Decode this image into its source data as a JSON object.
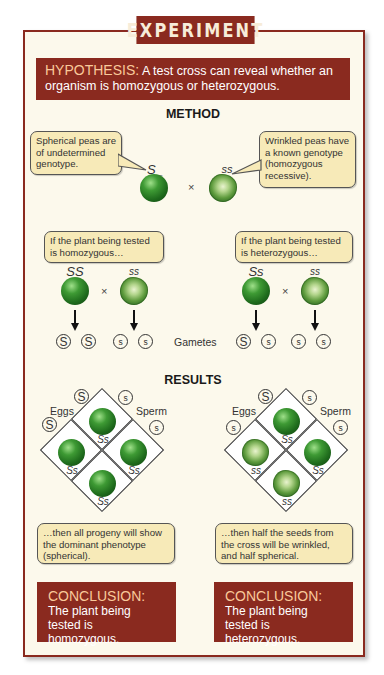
{
  "banner": {
    "title": "EXPERIMENT"
  },
  "hypothesis": {
    "label": "HYPOTHESIS:",
    "text": "A test cross can reveal whether an organism is homozygous or heterozygous."
  },
  "method": {
    "title": "METHOD",
    "left_callout": "Spherical peas are of undetermined genotype.",
    "right_callout": "Wrinkled peas have a known genotype (homozygous recessive).",
    "parent_left_genotype": "S_",
    "parent_right_genotype": "ss",
    "cross_symbol": "×",
    "cases": [
      {
        "callout": "If the plant being tested is homozygous…",
        "parent1_genotype": "SS",
        "parent2_genotype": "ss",
        "gametes": [
          "S",
          "S",
          "s",
          "s"
        ]
      },
      {
        "callout": "If the plant being tested is heterozygous…",
        "parent1_genotype": "Ss",
        "parent2_genotype": "ss",
        "gametes": [
          "S",
          "s",
          "s",
          "s"
        ]
      }
    ],
    "gametes_label": "Gametes"
  },
  "results": {
    "title": "RESULTS",
    "eggs_label": "Eggs",
    "sperm_label": "Sperm",
    "squares": [
      {
        "egg_alleles": [
          "S",
          "S"
        ],
        "sperm_alleles": [
          "s",
          "s"
        ],
        "cells": [
          {
            "genotype": "Ss",
            "phenotype": "spherical"
          },
          {
            "genotype": "Ss",
            "phenotype": "spherical"
          },
          {
            "genotype": "Ss",
            "phenotype": "spherical"
          },
          {
            "genotype": "Ss",
            "phenotype": "spherical"
          }
        ],
        "callout": "…then all progeny will show the dominant phenotype (spherical)."
      },
      {
        "egg_alleles": [
          "S",
          "s"
        ],
        "sperm_alleles": [
          "s",
          "s"
        ],
        "cells": [
          {
            "genotype": "Ss",
            "phenotype": "spherical"
          },
          {
            "genotype": "ss",
            "phenotype": "wrinkled"
          },
          {
            "genotype": "Ss",
            "phenotype": "spherical"
          },
          {
            "genotype": "ss",
            "phenotype": "wrinkled"
          }
        ],
        "callout": "…then half the seeds from the cross will be wrinkled, and half spherical."
      }
    ]
  },
  "conclusions": [
    {
      "label": "CONCLUSION:",
      "text": "The plant being tested is homozygous."
    },
    {
      "label": "CONCLUSION:",
      "text": "The plant being tested is heterozygous."
    }
  ],
  "colors": {
    "brand_red": "#8a2a1f",
    "frame_bg": "#fcf9ec",
    "callout_bg": "#f7eab8",
    "highlight_text": "#f9c99a",
    "pea_green": "#2e7d26"
  }
}
